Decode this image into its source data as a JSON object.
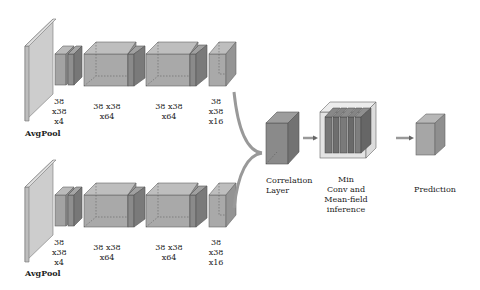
{
  "branches": [
    {
      "name": "top",
      "labels": {
        "pool": "AvgPool",
        "b1": "38\nx38\nx4",
        "b2": "38 x38\nx64",
        "b3": "38 x38\nx64",
        "b4": "38\nx38\nx16"
      }
    },
    {
      "name": "bottom",
      "labels": {
        "pool": "AvgPool",
        "b1": "38\nx38\nx4",
        "b2": "38 x38\nx64",
        "b3": "38 x38\nx64",
        "b4": "38\nx38\nx16"
      }
    }
  ],
  "head": {
    "correlation": "Correlation\nLayer",
    "min_conv": "Min\nConv and\nMean-field\ninference",
    "prediction": "Prediction"
  },
  "colors": {
    "pool": "#cfcfcf",
    "block": "#a9a9a9",
    "dark": "#7d7d7d",
    "corr": "#8a8a8a",
    "pred": "#a6a6a6",
    "frame": "#e6e6e6",
    "arrow": "#9a9a9a"
  }
}
